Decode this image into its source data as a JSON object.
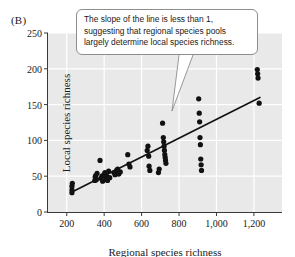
{
  "panel": {
    "label": "(B)"
  },
  "callout": {
    "text": "The slope of the line is less than 1, suggesting that regional species pools largely determine local species richness."
  },
  "chart_data": {
    "type": "scatter",
    "title": "",
    "xlabel": "Regional species richness",
    "ylabel": "Local species richness",
    "xlim": [
      100,
      1350
    ],
    "ylim": [
      0,
      250
    ],
    "xticks": [
      200,
      400,
      600,
      800,
      1000,
      1200
    ],
    "xticklabels": [
      "200",
      "400",
      "600",
      "800",
      "1,000",
      "1,200"
    ],
    "yticks": [
      0,
      50,
      100,
      150,
      200,
      250
    ],
    "yticklabels": [
      "0",
      "50",
      "100",
      "150",
      "200",
      "250"
    ],
    "grid": "white gridlines on light gray panel background",
    "legend": "none",
    "point_color": "#111111",
    "line_color": "#111111",
    "panel_background": "#e9e9e9",
    "gridline_color": "#ffffff",
    "points": [
      [
        228,
        27
      ],
      [
        228,
        31
      ],
      [
        228,
        36
      ],
      [
        230,
        40
      ],
      [
        350,
        44
      ],
      [
        352,
        49
      ],
      [
        355,
        51
      ],
      [
        358,
        45
      ],
      [
        362,
        54
      ],
      [
        378,
        72
      ],
      [
        382,
        47
      ],
      [
        388,
        50
      ],
      [
        392,
        43
      ],
      [
        398,
        52
      ],
      [
        404,
        55
      ],
      [
        410,
        46
      ],
      [
        414,
        50
      ],
      [
        418,
        44
      ],
      [
        424,
        57
      ],
      [
        430,
        48
      ],
      [
        452,
        55
      ],
      [
        458,
        52
      ],
      [
        466,
        58
      ],
      [
        472,
        60
      ],
      [
        478,
        53
      ],
      [
        486,
        56
      ],
      [
        526,
        80
      ],
      [
        532,
        67
      ],
      [
        538,
        63
      ],
      [
        630,
        86
      ],
      [
        634,
        92
      ],
      [
        638,
        78
      ],
      [
        640,
        64
      ],
      [
        644,
        58
      ],
      [
        690,
        55
      ],
      [
        694,
        60
      ],
      [
        712,
        124
      ],
      [
        716,
        104
      ],
      [
        718,
        98
      ],
      [
        720,
        92
      ],
      [
        722,
        86
      ],
      [
        724,
        80
      ],
      [
        726,
        76
      ],
      [
        728,
        72
      ],
      [
        730,
        68
      ],
      [
        905,
        158
      ],
      [
        908,
        138
      ],
      [
        910,
        126
      ],
      [
        912,
        104
      ],
      [
        914,
        94
      ],
      [
        916,
        74
      ],
      [
        918,
        66
      ],
      [
        920,
        58
      ],
      [
        1218,
        199
      ],
      [
        1220,
        193
      ],
      [
        1222,
        187
      ],
      [
        1228,
        152
      ]
    ],
    "trendline": {
      "x": [
        228,
        1232
      ],
      "y": [
        28,
        160
      ]
    }
  }
}
